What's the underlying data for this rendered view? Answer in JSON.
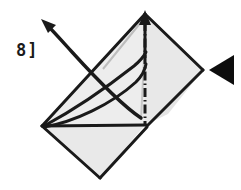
{
  "diagram": {
    "step_label": "8]",
    "background_color": "#ffffff",
    "paper": {
      "fill_color": "#ececec",
      "fill_color_shaded": "#e3e3e3",
      "fill_color_light": "#f1f1f1",
      "outline_color": "#1a1a1a",
      "outline_width": 3
    },
    "shapes": {
      "upper_right_panel": {
        "name": "upper-right-panel",
        "points": "145,14 203,70 145,125 145,14",
        "fill": "#e8e8e8"
      },
      "upper_left_panel": {
        "name": "upper-left-panel",
        "points": "145,14 145,125 42,126 145,14",
        "fill": "#ededed"
      },
      "lower_panel": {
        "name": "lower-panel",
        "points": "42,126 145,125 100,178 42,126",
        "fill": "#e9e9e9"
      },
      "lower_right_flap": {
        "name": "lower-right-flap",
        "points": "145,125 203,70 166,117 145,125",
        "fill": "#e5e5e5"
      }
    },
    "fold_lines": {
      "mountain_fold": {
        "name": "mountain-fold-line",
        "style": "dash-dot",
        "from": [
          145,
          20
        ],
        "to": [
          145,
          124
        ],
        "color": "#1a1a1a"
      },
      "crease_hint_a": {
        "name": "crease-hint-line-a",
        "from": [
          145,
          16
        ],
        "to": [
          103,
          68
        ],
        "color": "#b9b9b9"
      },
      "crease_hint_b": {
        "name": "crease-hint-line-b",
        "from": [
          145,
          18
        ],
        "to": [
          141,
          120
        ],
        "color": "#c2c2c2"
      }
    },
    "arrows": {
      "up_arrow": {
        "name": "up-arrow",
        "description": "straight vertical arrow at top vertex pointing up",
        "from": [
          145,
          56
        ],
        "to": [
          145,
          12
        ],
        "color": "#1a1a1a"
      },
      "fold_arrow": {
        "name": "curved-fold-arrow",
        "description": "curved arrow sweeping from lower right up to upper left",
        "tail": [
          140,
          118
        ],
        "head": [
          44,
          22
        ],
        "color": "#1a1a1a"
      },
      "push_arrow": {
        "name": "push-arrow-triangle",
        "description": "solid black triangle pointing left",
        "points": "234,56 234,84 210,70",
        "color": "#0d0d0d"
      }
    }
  }
}
